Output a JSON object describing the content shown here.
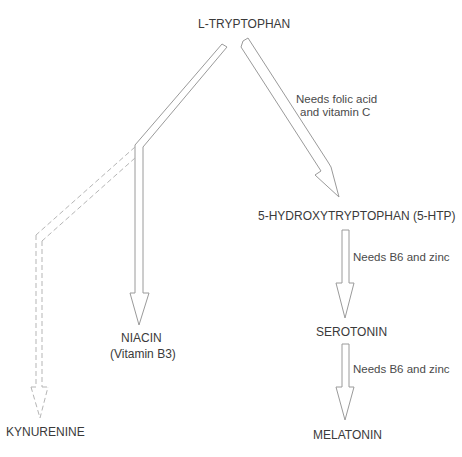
{
  "diagram": {
    "title": "L-TRYPTOPHAN",
    "nodes": {
      "kynurenine": "KYNURENINE",
      "niacin": "NIACIN",
      "niacin_sub": "(Vitamin B3)",
      "htp": "5-HYDROXYTRYPTOPHAN (5-HTP)",
      "serotonin": "SEROTONIN",
      "melatonin": "MELATONIN"
    },
    "notes": {
      "to_htp_line1": "Needs folic acid",
      "to_htp_line2": "and vitamin C",
      "to_serotonin": "Needs B6 and zinc",
      "to_melatonin": "Needs B6 and zinc"
    },
    "edges": [
      {
        "from": "L-TRYPTOPHAN",
        "to": "NIACIN",
        "style": "solid"
      },
      {
        "from": "L-TRYPTOPHAN",
        "to": "KYNURENINE",
        "style": "dashed"
      },
      {
        "from": "L-TRYPTOPHAN",
        "to": "5-HYDROXYTRYPTOPHAN (5-HTP)",
        "style": "solid",
        "label": "Needs folic acid and vitamin C"
      },
      {
        "from": "5-HYDROXYTRYPTOPHAN (5-HTP)",
        "to": "SEROTONIN",
        "style": "solid",
        "label": "Needs B6 and zinc"
      },
      {
        "from": "SEROTONIN",
        "to": "MELATONIN",
        "style": "solid",
        "label": "Needs B6 and zinc"
      }
    ],
    "colors": {
      "line": "#9a9a9a",
      "text": "#3a3a3a"
    }
  }
}
